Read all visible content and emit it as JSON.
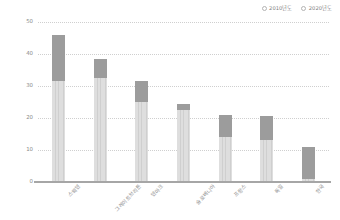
{
  "chart_data": {
    "type": "bar",
    "subtype": "stacked-column",
    "title": "",
    "xlabel": "",
    "ylabel": "",
    "ylim": [
      0,
      50
    ],
    "yticks": [
      "0",
      "10",
      "20",
      "30",
      "40",
      "50"
    ],
    "grid": true,
    "legend_position": "top-right",
    "categories": [
      "스웨덴",
      "그레이트브리튼",
      "덴마크",
      "슬로베니아",
      "프랑스",
      "독일",
      "한국"
    ],
    "series": [
      {
        "name": "2010년도",
        "values": [
          31.5,
          32.5,
          25.0,
          22.5,
          14.0,
          13.0,
          1.0
        ],
        "color": "#d6d6d6"
      },
      {
        "name": "2020년도",
        "values": [
          14.5,
          6.0,
          6.5,
          2.0,
          7.0,
          7.5,
          10.0
        ],
        "color": "#9c9c9c"
      }
    ],
    "totals": [
      46.0,
      38.5,
      31.5,
      24.5,
      21.0,
      20.5,
      11.0
    ]
  },
  "legend": {
    "items": [
      {
        "label": "2010년도",
        "marker": "circle-outline-icon"
      },
      {
        "label": "2020년도",
        "marker": "circle-outline-icon"
      }
    ]
  },
  "axes": {
    "y": {
      "ticks": [
        "0",
        "10",
        "20",
        "30",
        "40",
        "50"
      ],
      "min": 0,
      "max": 50
    },
    "x": {
      "ticks": [
        "스웨덴",
        "그레이트브리튼",
        "덴마크",
        "슬로베니아",
        "프랑스",
        "독일",
        "한국"
      ]
    }
  },
  "colors": {
    "series_2010": "#d6d6d6",
    "series_2020": "#9c9c9c",
    "gridline": "#cfcfcf",
    "axis": "#a6a6a6",
    "text": "#8a8a8a",
    "background": "#ffffff"
  }
}
